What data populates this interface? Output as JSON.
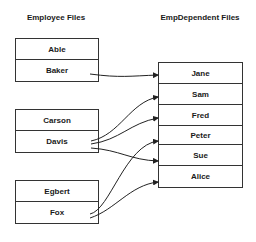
{
  "left_title": "Employee Files",
  "right_title": "EmpDependent Files",
  "employee_groups": [
    {
      "records": [
        "Able",
        "Baker"
      ]
    },
    {
      "records": [
        "Carson",
        "Davis"
      ]
    },
    {
      "records": [
        "Egbert",
        "Fox"
      ]
    }
  ],
  "dependents": [
    "Jane",
    "Sam",
    "Fred",
    "Peter",
    "Sue",
    "Alice"
  ],
  "links": [
    {
      "from": "Baker",
      "to": "Jane"
    },
    {
      "from": "Davis",
      "to": "Sam"
    },
    {
      "from": "Davis",
      "to": "Fred"
    },
    {
      "from": "Davis",
      "to": "Sue"
    },
    {
      "from": "Fox",
      "to": "Peter"
    },
    {
      "from": "Fox",
      "to": "Alice"
    }
  ]
}
